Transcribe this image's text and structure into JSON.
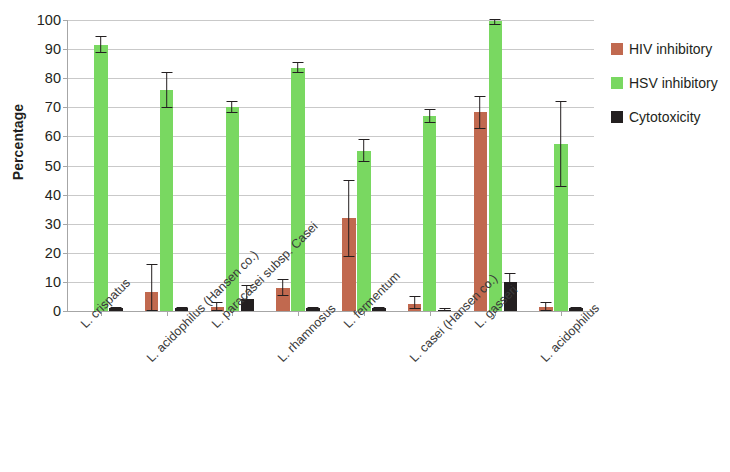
{
  "chart_data": {
    "type": "bar",
    "title": "",
    "xlabel": "",
    "ylabel": "Percentage",
    "ylim": [
      0,
      100
    ],
    "ytick_step": 10,
    "yticks": [
      100,
      90,
      80,
      70,
      60,
      50,
      40,
      30,
      20,
      10,
      0
    ],
    "grid": true,
    "legend_position": "right",
    "categories": [
      "L. crispatus",
      "L. acidophilus (Hansen co.)",
      "L. paracasei subsp. Casei",
      "L. rhamnosus",
      "L. fermentum",
      "L. casei (Hansen co.)",
      "L. gasseri",
      "L. acidophilus"
    ],
    "series": [
      {
        "name": "HIV inhibitory",
        "color": "#c1694f",
        "values": [
          0,
          6.5,
          1.5,
          8,
          32,
          2.5,
          68.5,
          1.5
        ],
        "err_low": [
          0,
          0.5,
          0.5,
          5.5,
          19,
          1,
          63,
          0.5
        ],
        "err_high": [
          0,
          16,
          3,
          11,
          45,
          5,
          74,
          3
        ]
      },
      {
        "name": "HSV inhibitory",
        "color": "#79d861",
        "values": [
          91.5,
          76,
          70,
          83.5,
          55,
          67,
          99.5,
          57.5
        ],
        "err_low": [
          89,
          70,
          68.5,
          82,
          51.5,
          65,
          98.5,
          43
        ],
        "err_high": [
          94.5,
          82,
          72,
          85.5,
          59,
          69.5,
          100.5,
          72
        ]
      },
      {
        "name": "Cytotoxicity",
        "color": "#231f20",
        "values": [
          1,
          1,
          4,
          1,
          1,
          0.5,
          10,
          1
        ],
        "err_low": [
          1,
          1,
          1,
          1,
          1,
          0.5,
          7.5,
          1
        ],
        "err_high": [
          1.5,
          1.5,
          9,
          1.5,
          1.5,
          1,
          13,
          1.5
        ]
      }
    ]
  },
  "legend": {
    "items": [
      {
        "label": "HIV inhibitory",
        "swatch": "hiv"
      },
      {
        "label": "HSV inhibitory",
        "swatch": "hsv"
      },
      {
        "label": "Cytotoxicity",
        "swatch": "cyto"
      }
    ]
  }
}
